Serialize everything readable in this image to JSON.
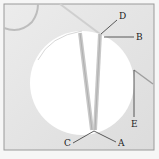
{
  "diagram": {
    "labels": {
      "A": "A",
      "B": "B",
      "C": "C",
      "D": "D",
      "E": "E"
    },
    "colors": {
      "background": "#e6e6e6",
      "frame_border": "#9a9a9a",
      "disk": "#ffffff",
      "thread": "#c4c4c4",
      "leader_line": "#333333"
    }
  }
}
